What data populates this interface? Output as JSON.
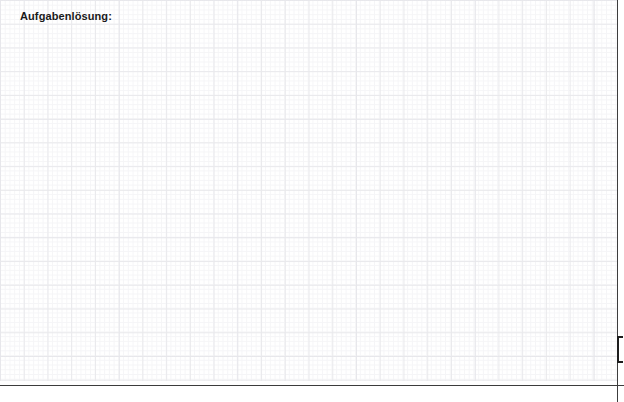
{
  "page": {
    "title_label": "Aufgabenlösung:",
    "background_color": "#ffffff",
    "width": 624,
    "height": 402
  },
  "grid": {
    "icon_name": "graph-paper-grid",
    "major_line_color": "#e9e9ec",
    "minor_line_color": "#f5f5f7",
    "major_cell_px": 23.74,
    "minor_cell_px": 4.75,
    "columns": 26,
    "rows": 16
  },
  "answer_area": {
    "name": "answer-writing-area",
    "content": "",
    "placeholder": ""
  },
  "rules": {
    "vertical_rule_color": "#3c3c3c",
    "horizontal_rule_color": "#3c3c3c",
    "vertical_rule_x": 617,
    "horizontal_rule_y": 385
  },
  "bracket_marker": {
    "icon_name": "square-bracket-open-icon",
    "color": "#1d1d1d",
    "x": 617,
    "y": 336,
    "height": 27
  }
}
